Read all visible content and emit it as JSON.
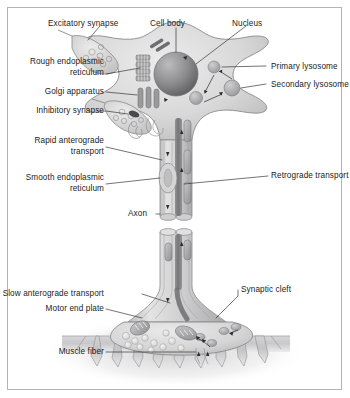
{
  "figure": {
    "border_color": "#b4b4b4",
    "background_color": "#ffffff",
    "ink_color": "#1b1b1b",
    "cell_fill": "#d9d9d9",
    "cell_outline": "#8a8a8a",
    "nucleus_color": "#808080",
    "muscle_color": "#c8c8c8"
  },
  "labels": {
    "excitatory_synapse": "Excitatory synapse",
    "cell_body": "Cell body",
    "nucleus": "Nucleus",
    "rough_er_line1": "Rough endoplasmic",
    "rough_er_line2": "reticulum",
    "golgi": "Golgi apparatus",
    "primary_lysosome": "Primary lysosome",
    "secondary_lysosome": "Secondary lysosome",
    "inhibitory_synapse": "Inhibitory synapse",
    "rapid_anterograde_line1": "Rapid anterograde",
    "rapid_anterograde_line2": "transport",
    "smooth_er_line1": "Smooth endoplasmic",
    "smooth_er_line2": "reticulum",
    "retrograde_transport": "Retrograde transport",
    "axon": "Axon",
    "slow_anterograde": "Slow anterograde transport",
    "motor_end_plate": "Motor end plate",
    "synaptic_cleft": "Synaptic cleft",
    "muscle_fiber": "Muscle fiber"
  }
}
